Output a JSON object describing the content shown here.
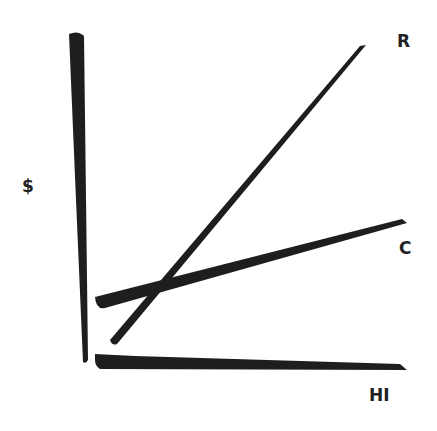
{
  "diagram": {
    "y_axis_label": "$",
    "x_axis_label": "HI",
    "lines": [
      {
        "name": "revenue-line",
        "label": "R"
      },
      {
        "name": "cost-line",
        "label": "C"
      }
    ],
    "ink_color": "#1e1e1e"
  }
}
